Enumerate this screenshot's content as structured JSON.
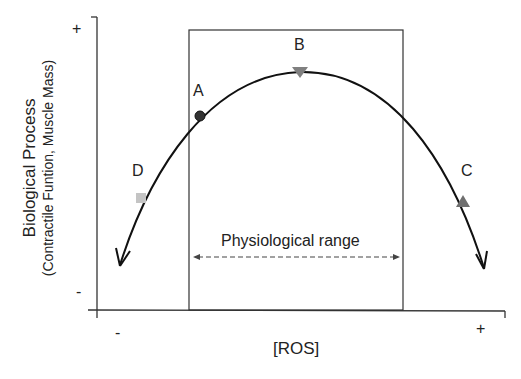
{
  "diagram": {
    "y_axis": {
      "title": "Biological Process",
      "subtitle": "(Contractile Funtion, Muscle Mass)",
      "top_sign": "+",
      "bottom_sign": "-"
    },
    "x_axis": {
      "title": "[ROS]",
      "left_sign": "-",
      "right_sign": "+"
    },
    "range": {
      "label": "Physiological range"
    },
    "points": [
      {
        "id": "A",
        "label": "A",
        "marker": "circle",
        "color": "#333333"
      },
      {
        "id": "B",
        "label": "B",
        "marker": "triangle-down",
        "color": "#808080"
      },
      {
        "id": "C",
        "label": "C",
        "marker": "triangle-up",
        "color": "#6e6e6e"
      },
      {
        "id": "D",
        "label": "D",
        "marker": "square",
        "color": "#c4c4c4"
      }
    ],
    "colors": {
      "line": "#111111",
      "axis": "#333333"
    }
  }
}
